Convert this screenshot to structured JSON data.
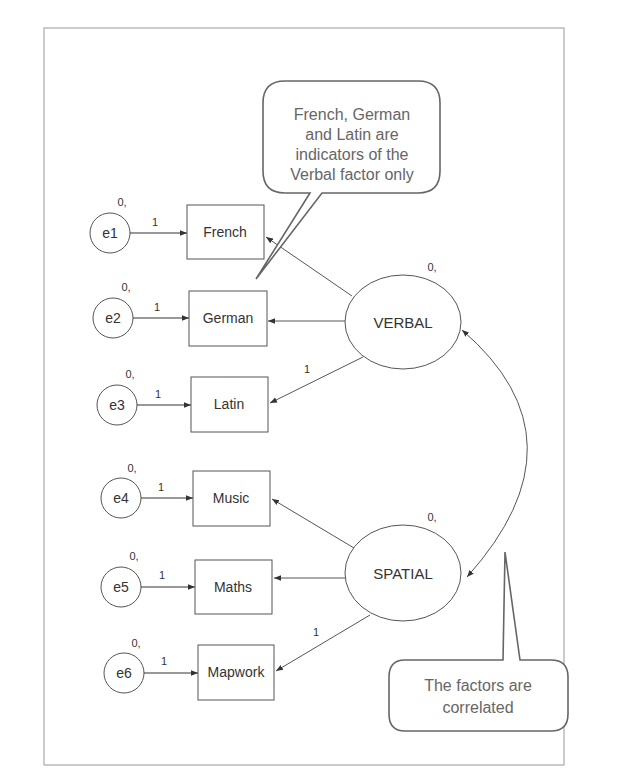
{
  "diagram": {
    "type": "confirmatory-factor-analysis-path-diagram",
    "error_terms": [
      {
        "id": "e1",
        "label": "e1",
        "mean_label": "0,",
        "path_label": "1"
      },
      {
        "id": "e2",
        "label": "e2",
        "mean_label": "0,",
        "path_label": "1"
      },
      {
        "id": "e3",
        "label": "e3",
        "mean_label": "0,",
        "path_label": "1"
      },
      {
        "id": "e4",
        "label": "e4",
        "mean_label": "0,",
        "path_label": "1"
      },
      {
        "id": "e5",
        "label": "e5",
        "mean_label": "0,",
        "path_label": "1"
      },
      {
        "id": "e6",
        "label": "e6",
        "mean_label": "0,",
        "path_label": "1"
      }
    ],
    "indicators": [
      {
        "id": "french",
        "label": "French",
        "factor": "VERBAL"
      },
      {
        "id": "german",
        "label": "German",
        "factor": "VERBAL"
      },
      {
        "id": "latin",
        "label": "Latin",
        "factor": "VERBAL",
        "loading_label": "1"
      },
      {
        "id": "music",
        "label": "Music",
        "factor": "SPATIAL"
      },
      {
        "id": "maths",
        "label": "Maths",
        "factor": "SPATIAL"
      },
      {
        "id": "mapwork",
        "label": "Mapwork",
        "factor": "SPATIAL",
        "loading_label": "1"
      }
    ],
    "factors": [
      {
        "id": "verbal",
        "label": "VERBAL",
        "mean_label": "0,"
      },
      {
        "id": "spatial",
        "label": "SPATIAL",
        "mean_label": "0,"
      }
    ],
    "correlation": {
      "from": "VERBAL",
      "to": "SPATIAL",
      "type": "double-headed-arrow"
    },
    "callouts": [
      {
        "id": "indicators-note",
        "lines": [
          "French, German",
          "and Latin are",
          "indicators of the",
          "Verbal factor only"
        ]
      },
      {
        "id": "correlation-note",
        "lines": [
          "The factors are",
          "correlated"
        ]
      }
    ]
  }
}
